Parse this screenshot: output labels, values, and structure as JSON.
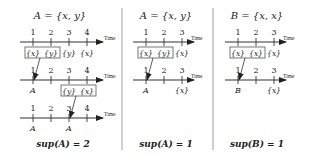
{
  "time_label": "Time",
  "panels": [
    {
      "title": "A = {x, y}",
      "rows": [
        {
          "ticks": [
            "1",
            "2",
            "3",
            "4"
          ],
          "events": [
            "{x}",
            "{y}",
            "{y}",
            "{x}"
          ],
          "boxed": [
            0,
            1
          ]
        },
        {
          "ticks": [
            "1",
            "2",
            "3",
            "4"
          ],
          "marks_below": [
            "A",
            "",
            "",
            ""
          ],
          "events": [
            "",
            "",
            "{y}",
            "{x}"
          ],
          "boxed": [
            2,
            3
          ]
        },
        {
          "ticks": [
            "1",
            "2",
            "3",
            "4"
          ],
          "marks_below": [
            "A",
            "",
            "A",
            ""
          ]
        }
      ],
      "result": "sup(A) = 2"
    },
    {
      "title": "A = {x, y}",
      "rows": [
        {
          "ticks": [
            "1",
            "2",
            "3"
          ],
          "events": [
            "{x}",
            "{y}",
            "{x}"
          ],
          "boxed": [
            0,
            1
          ]
        },
        {
          "ticks": [
            "1",
            "2",
            "3"
          ],
          "marks_below": [
            "A",
            "",
            "{x}"
          ]
        }
      ],
      "result": "sup(A) = 1"
    },
    {
      "title": "B = {x, x}",
      "rows": [
        {
          "ticks": [
            "1",
            "2",
            "3"
          ],
          "events": [
            "{x}",
            "{x}",
            "{x}"
          ],
          "boxed": [
            0,
            1
          ]
        },
        {
          "ticks": [
            "1",
            "2",
            "3"
          ],
          "marks_below": [
            "B",
            "",
            "{x}"
          ]
        }
      ],
      "result": "sup(B) = 1"
    }
  ]
}
